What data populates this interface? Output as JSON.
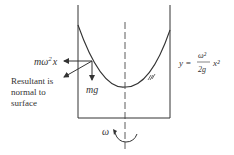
{
  "diagram": {
    "force_centrifugal_label": "mω²x",
    "force_centrifugal_base": "mω",
    "force_centrifugal_sup": "2",
    "force_centrifugal_tail": "x",
    "force_gravity_label": "mg",
    "resultant_line1": "Resultant is",
    "resultant_line2": "normal to",
    "resultant_line3": "surface",
    "equation_lhs": "y =",
    "equation_num": "ω²",
    "equation_den": "2g",
    "equation_rhs": "x²",
    "rotation_label": "ω",
    "colors": {
      "line": "#333333",
      "background": "#ffffff"
    }
  }
}
